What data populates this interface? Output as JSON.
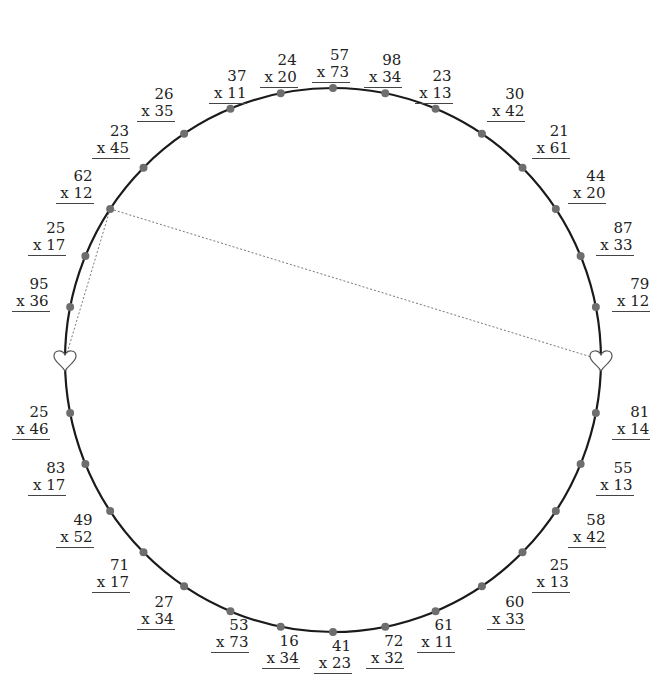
{
  "diagram": {
    "title": "",
    "circle": {
      "cx": 333,
      "cy": 360,
      "rx": 268,
      "ry": 272,
      "stroke": "#1a1a1a"
    },
    "dot_color": "#6e6e6e",
    "chord_color": "#777777",
    "positions": [
      {
        "angle": 90,
        "type": "dot",
        "top": "57",
        "bottom": "x 73"
      },
      {
        "angle": 78.75,
        "type": "dot",
        "top": "98",
        "bottom": "x 34"
      },
      {
        "angle": 67.5,
        "type": "dot",
        "top": "23",
        "bottom": "x 13"
      },
      {
        "angle": 56.25,
        "type": "dot",
        "top": "30",
        "bottom": "x 42"
      },
      {
        "angle": 45,
        "type": "dot",
        "top": "21",
        "bottom": "x 61"
      },
      {
        "angle": 33.75,
        "type": "dot",
        "top": "44",
        "bottom": "x 20"
      },
      {
        "angle": 22.5,
        "type": "dot",
        "top": "87",
        "bottom": "x 33"
      },
      {
        "angle": 11.25,
        "type": "dot",
        "top": "79",
        "bottom": "x 12"
      },
      {
        "angle": 0,
        "type": "heart"
      },
      {
        "angle": -11.25,
        "type": "dot",
        "top": "81",
        "bottom": "x 14"
      },
      {
        "angle": -22.5,
        "type": "dot",
        "top": "55",
        "bottom": "x 13"
      },
      {
        "angle": -33.75,
        "type": "dot",
        "top": "58",
        "bottom": "x 42"
      },
      {
        "angle": -45,
        "type": "dot",
        "top": "25",
        "bottom": "x 13"
      },
      {
        "angle": -56.25,
        "type": "dot",
        "top": "60",
        "bottom": "x 33"
      },
      {
        "angle": -67.5,
        "type": "dot",
        "top": "61",
        "bottom": "x 11"
      },
      {
        "angle": -78.75,
        "type": "dot",
        "top": "72",
        "bottom": "x 32"
      },
      {
        "angle": -90,
        "type": "dot",
        "top": "41",
        "bottom": "x 23"
      },
      {
        "angle": -101.25,
        "type": "dot",
        "top": "16",
        "bottom": "x 34"
      },
      {
        "angle": -112.5,
        "type": "dot",
        "top": "53",
        "bottom": "x 73"
      },
      {
        "angle": -123.75,
        "type": "dot",
        "top": "27",
        "bottom": "x 34"
      },
      {
        "angle": -135,
        "type": "dot",
        "top": "71",
        "bottom": "x 17"
      },
      {
        "angle": -146.25,
        "type": "dot",
        "top": "49",
        "bottom": "x 52"
      },
      {
        "angle": -157.5,
        "type": "dot",
        "top": "83",
        "bottom": "x 17"
      },
      {
        "angle": -168.75,
        "type": "dot",
        "top": "25",
        "bottom": "x 46"
      },
      {
        "angle": 180,
        "type": "heart"
      },
      {
        "angle": 168.75,
        "type": "dot",
        "top": "95",
        "bottom": "x 36"
      },
      {
        "angle": 157.5,
        "type": "dot",
        "top": "25",
        "bottom": "x 17"
      },
      {
        "angle": 146.25,
        "type": "dot",
        "top": "62",
        "bottom": "x 12"
      },
      {
        "angle": 135,
        "type": "dot",
        "top": "23",
        "bottom": "x 45"
      },
      {
        "angle": 123.75,
        "type": "dot",
        "top": "26",
        "bottom": "x 35"
      },
      {
        "angle": 112.5,
        "type": "dot",
        "top": "37",
        "bottom": "x 11"
      },
      {
        "angle": 101.25,
        "type": "dot",
        "top": "24",
        "bottom": "x 20"
      }
    ],
    "chords": [
      {
        "from_angle": 146.25,
        "to_angle": 0
      },
      {
        "from_angle": 146.25,
        "to_angle": 180
      }
    ]
  }
}
